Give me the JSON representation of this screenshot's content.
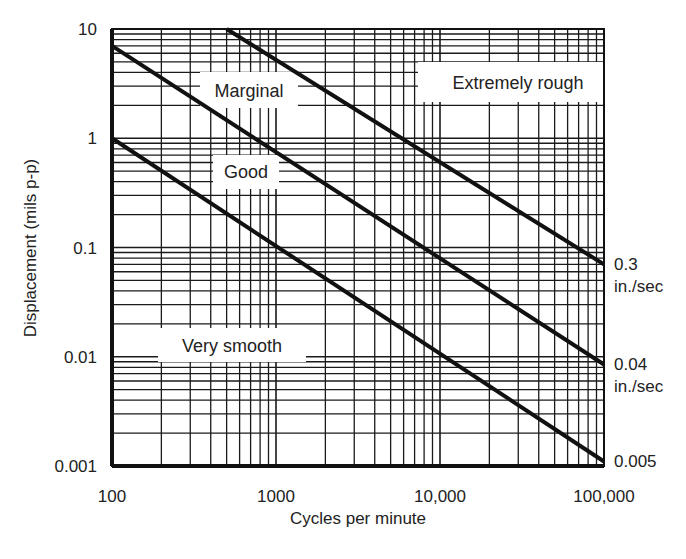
{
  "chart_data": {
    "type": "line",
    "title": "",
    "xlabel": "Cycles per minute",
    "ylabel": "Displacement  (mils p-p)",
    "xscale": "log",
    "yscale": "log",
    "xlim": [
      100,
      100000
    ],
    "ylim": [
      0.001,
      10
    ],
    "grid": true,
    "x_ticks": [
      {
        "value": 100,
        "label": "100"
      },
      {
        "value": 1000,
        "label": "1000"
      },
      {
        "value": 10000,
        "label": "10,000"
      },
      {
        "value": 100000,
        "label": "100,000"
      }
    ],
    "y_ticks": [
      {
        "value": 10,
        "label": "10"
      },
      {
        "value": 1,
        "label": "1"
      },
      {
        "value": 0.1,
        "label": "0.1"
      },
      {
        "value": 0.01,
        "label": "0.01"
      },
      {
        "value": 0.001,
        "label": "0.001"
      }
    ],
    "series": [
      {
        "name": "0.3 in./sec",
        "label_line1": "0.3",
        "label_line2": "in./sec",
        "x": [
          500,
          100000
        ],
        "y": [
          10,
          0.07
        ]
      },
      {
        "name": "0.04 in./sec",
        "label_line1": "0.04",
        "label_line2": "in./sec",
        "x": [
          100,
          100000
        ],
        "y": [
          7,
          0.0085
        ]
      },
      {
        "name": "0.005",
        "label_line1": "0.005",
        "label_line2": "",
        "x": [
          100,
          100000
        ],
        "y": [
          1,
          0.0011
        ]
      }
    ],
    "zones": [
      {
        "label": "Extremely rough",
        "x": 2600,
        "y": 4.5
      },
      {
        "label": "Marginal",
        "x": 430,
        "y": 2.7
      },
      {
        "label": "Good",
        "x": 440,
        "y": 0.27
      },
      {
        "label": "Very smooth",
        "x": 300,
        "y": 0.011
      }
    ]
  }
}
